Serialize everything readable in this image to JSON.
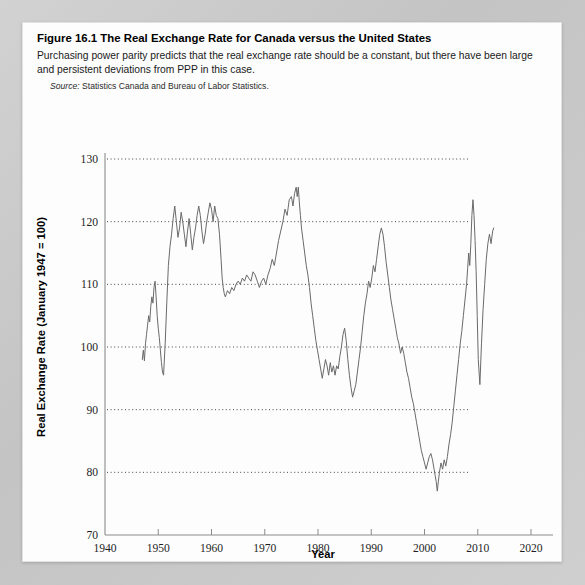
{
  "figure": {
    "number": "Figure 16.1",
    "title": "The Real Exchange Rate for Canada versus the United States",
    "description": "Purchasing power parity predicts that the real exchange rate should be a constant, but there have been large and persistent deviations from PPP in this case.",
    "source_lead": "Source:",
    "source_text": "Statistics Canada and Bureau of Labor Statistics."
  },
  "chart_data": {
    "type": "line",
    "title": "The Real Exchange Rate for Canada versus the United States",
    "xlabel": "Year",
    "ylabel": "Real Exchange Rate (January 1947 = 100)",
    "xlim": [
      1940,
      2020
    ],
    "ylim": [
      70,
      130
    ],
    "xticks": [
      1940,
      1950,
      1960,
      1970,
      1980,
      1990,
      2000,
      2010,
      2020
    ],
    "yticks": [
      70,
      80,
      90,
      100,
      110,
      120,
      130
    ],
    "xtick_labels": [
      "1940",
      "1950",
      "1960",
      "1970",
      "1980",
      "1990",
      "2000",
      "2010",
      "2020"
    ],
    "ytick_labels": [
      "70",
      "80",
      "90",
      "100",
      "110",
      "120",
      "130"
    ],
    "grid": "horizontal-dotted",
    "legend": "none",
    "line_color": "#6a6a6a",
    "series": [
      {
        "name": "Canada/US Real Exchange Rate (January 1947 = 100)",
        "x": [
          1947.0,
          1947.2,
          1947.4,
          1947.6,
          1947.8,
          1948.0,
          1948.2,
          1948.4,
          1948.6,
          1948.8,
          1949.0,
          1949.2,
          1949.4,
          1949.6,
          1949.8,
          1950.0,
          1950.2,
          1950.4,
          1950.6,
          1950.8,
          1951.0,
          1951.3,
          1951.6,
          1951.9,
          1952.2,
          1952.5,
          1952.8,
          1953.1,
          1953.4,
          1953.7,
          1954.0,
          1954.3,
          1954.6,
          1954.9,
          1955.2,
          1955.5,
          1955.8,
          1956.1,
          1956.4,
          1956.7,
          1957.0,
          1957.3,
          1957.6,
          1957.9,
          1958.2,
          1958.5,
          1958.8,
          1959.1,
          1959.4,
          1959.7,
          1960.0,
          1960.3,
          1960.6,
          1960.9,
          1961.2,
          1961.5,
          1961.8,
          1962.0,
          1962.2,
          1962.4,
          1962.6,
          1962.8,
          1963.0,
          1963.4,
          1963.8,
          1964.2,
          1964.6,
          1965.0,
          1965.4,
          1965.8,
          1966.2,
          1966.6,
          1967.0,
          1967.4,
          1967.8,
          1968.2,
          1968.6,
          1969.0,
          1969.4,
          1969.8,
          1970.2,
          1970.6,
          1971.0,
          1971.4,
          1971.8,
          1972.2,
          1972.6,
          1973.0,
          1973.4,
          1973.8,
          1974.2,
          1974.6,
          1975.0,
          1975.3,
          1975.6,
          1975.9,
          1976.1,
          1976.3,
          1976.5,
          1976.7,
          1976.9,
          1977.2,
          1977.5,
          1977.8,
          1978.1,
          1978.4,
          1978.7,
          1979.0,
          1979.3,
          1979.6,
          1979.9,
          1980.2,
          1980.5,
          1980.8,
          1981.1,
          1981.4,
          1981.7,
          1982.0,
          1982.3,
          1982.6,
          1982.9,
          1983.2,
          1983.5,
          1983.8,
          1984.1,
          1984.4,
          1984.7,
          1985.0,
          1985.3,
          1985.6,
          1985.9,
          1986.2,
          1986.5,
          1986.8,
          1987.1,
          1987.4,
          1987.7,
          1988.0,
          1988.3,
          1988.6,
          1988.9,
          1989.2,
          1989.5,
          1989.8,
          1990.1,
          1990.4,
          1990.7,
          1991.0,
          1991.3,
          1991.6,
          1991.9,
          1992.2,
          1992.5,
          1992.8,
          1993.1,
          1993.4,
          1993.7,
          1994.0,
          1994.3,
          1994.6,
          1994.9,
          1995.2,
          1995.5,
          1995.8,
          1996.1,
          1996.4,
          1996.7,
          1997.0,
          1997.3,
          1997.6,
          1997.9,
          1998.2,
          1998.5,
          1998.8,
          1999.1,
          1999.4,
          1999.7,
          2000.0,
          2000.3,
          2000.6,
          2000.9,
          2001.2,
          2001.5,
          2001.8,
          2002.0,
          2002.2,
          2002.4,
          2002.6,
          2002.8,
          2003.1,
          2003.4,
          2003.7,
          2004.0,
          2004.3,
          2004.6,
          2004.9,
          2005.2,
          2005.5,
          2005.8,
          2006.1,
          2006.4,
          2006.7,
          2007.0,
          2007.3,
          2007.6,
          2007.9,
          2008.1,
          2008.3,
          2008.5,
          2008.7,
          2008.9,
          2009.1,
          2009.3,
          2009.5,
          2009.7,
          2009.9,
          2010.1,
          2010.4,
          2010.7,
          2011.0,
          2011.3,
          2011.6,
          2011.9,
          2012.2,
          2012.5,
          2012.8,
          2013.0
        ],
        "y": [
          98.0,
          99.5,
          97.8,
          100.5,
          102.0,
          103.5,
          105.0,
          104.0,
          106.5,
          108.0,
          107.0,
          109.5,
          110.5,
          108.0,
          105.0,
          103.0,
          101.5,
          99.5,
          97.5,
          96.0,
          95.5,
          100.5,
          107.0,
          113.0,
          116.0,
          118.0,
          120.5,
          122.5,
          120.0,
          117.5,
          119.0,
          121.5,
          120.0,
          118.0,
          116.0,
          118.5,
          120.5,
          118.0,
          115.5,
          117.5,
          119.0,
          121.0,
          122.5,
          121.0,
          118.5,
          116.5,
          118.0,
          120.0,
          121.5,
          123.0,
          122.0,
          120.0,
          122.5,
          121.0,
          120.5,
          118.0,
          114.0,
          111.0,
          109.5,
          108.5,
          108.0,
          108.5,
          109.0,
          108.5,
          109.5,
          109.0,
          110.0,
          110.5,
          110.0,
          111.0,
          110.5,
          111.5,
          111.0,
          110.5,
          112.0,
          111.5,
          110.5,
          109.5,
          110.5,
          111.0,
          110.0,
          111.5,
          112.5,
          114.0,
          113.0,
          115.0,
          117.0,
          118.5,
          120.0,
          122.0,
          121.0,
          123.5,
          124.0,
          122.5,
          124.5,
          125.5,
          124.0,
          125.5,
          123.0,
          121.0,
          119.0,
          117.0,
          115.0,
          113.0,
          111.5,
          109.5,
          107.0,
          105.0,
          103.0,
          101.0,
          99.5,
          98.0,
          96.5,
          95.0,
          96.5,
          98.0,
          97.0,
          95.5,
          97.5,
          96.0,
          97.0,
          95.5,
          97.0,
          96.5,
          98.5,
          100.0,
          102.0,
          103.0,
          101.0,
          98.0,
          95.5,
          93.5,
          92.0,
          93.0,
          94.0,
          96.0,
          98.0,
          100.0,
          102.5,
          105.0,
          107.0,
          108.5,
          110.5,
          109.5,
          111.0,
          113.0,
          112.0,
          114.0,
          116.0,
          118.0,
          119.0,
          118.0,
          116.0,
          113.5,
          111.5,
          109.5,
          107.5,
          106.0,
          104.5,
          103.0,
          101.5,
          100.5,
          99.0,
          100.0,
          99.0,
          97.5,
          96.0,
          95.0,
          93.5,
          92.0,
          91.0,
          89.5,
          88.0,
          86.5,
          85.0,
          83.5,
          82.5,
          81.5,
          80.5,
          81.5,
          82.5,
          83.0,
          82.0,
          80.5,
          79.5,
          78.5,
          77.0,
          78.5,
          80.0,
          81.5,
          80.5,
          82.0,
          81.0,
          82.5,
          84.5,
          86.0,
          88.0,
          90.5,
          93.0,
          95.5,
          98.0,
          100.5,
          102.5,
          105.0,
          107.5,
          110.0,
          112.5,
          115.0,
          113.0,
          116.5,
          121.0,
          123.5,
          121.0,
          117.0,
          112.0,
          105.0,
          98.0,
          94.0,
          100.5,
          106.0,
          110.0,
          114.0,
          116.5,
          118.0,
          116.5,
          118.5,
          119.0
        ]
      }
    ]
  },
  "axis": {
    "x_title": "Year",
    "y_title": "Real Exchange Rate (January 1947 = 100)"
  }
}
